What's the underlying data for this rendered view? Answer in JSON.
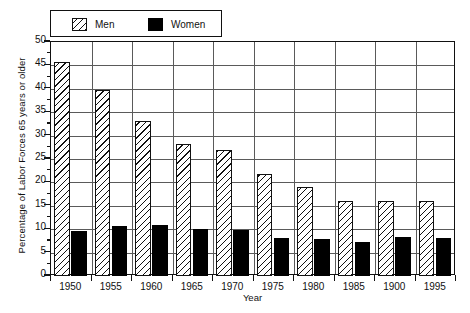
{
  "chart_data": {
    "type": "bar",
    "title": "",
    "xlabel": "Year",
    "ylabel": "Percentage of Labor Forces 65 years or older",
    "categories": [
      "1950",
      "1955",
      "1960",
      "1965",
      "1970",
      "1975",
      "1980",
      "1985",
      "1900",
      "1995"
    ],
    "series": [
      {
        "name": "Men",
        "values": [
          45.7,
          39.7,
          33.1,
          28.1,
          27.0,
          21.7,
          19.1,
          16.0,
          16.0,
          16.1
        ]
      },
      {
        "name": "Women",
        "values": [
          9.7,
          10.6,
          10.8,
          10.1,
          9.9,
          8.2,
          8.0,
          7.2,
          8.4,
          8.2
        ]
      }
    ],
    "ylim": [
      0,
      50
    ],
    "ytick_values": [
      0,
      5,
      10,
      15,
      20,
      25,
      30,
      35,
      40,
      45,
      50
    ],
    "ytick_labels": [
      "0",
      "5",
      "10",
      "15",
      "20",
      "25",
      "30",
      "35",
      "40",
      "45",
      "50"
    ],
    "grid": true,
    "grid_axis": "both",
    "legend_position": "top-left",
    "legend": [
      {
        "label": "Men",
        "swatch": "hatched-diagonal",
        "color": "#ffffff"
      },
      {
        "label": "Women",
        "swatch": "solid-fill",
        "color": "#000000"
      }
    ]
  },
  "colors": {
    "men_fill": "#ffffff",
    "men_hatch": "#111111",
    "women_fill": "#000000",
    "axis": "#111111",
    "grid": "#5a5a5a",
    "background": "#ffffff"
  }
}
